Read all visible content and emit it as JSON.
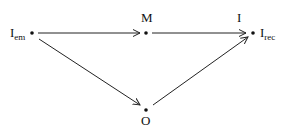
{
  "diagram": {
    "nodes": [
      {
        "id": "Iem",
        "label": "I",
        "subscript": "em"
      },
      {
        "id": "M",
        "label": "M"
      },
      {
        "id": "Irec",
        "top_label": "I",
        "label": "I",
        "subscript": "rec"
      },
      {
        "id": "O",
        "label": "O"
      }
    ],
    "edges": [
      {
        "from": "Iem",
        "to": "M"
      },
      {
        "from": "M",
        "to": "Irec",
        "label": "I"
      },
      {
        "from": "Iem",
        "to": "O"
      },
      {
        "from": "O",
        "to": "Irec"
      }
    ],
    "labels": {
      "iem_main": "I",
      "iem_sub": "em",
      "m": "M",
      "i_top": "I",
      "irec_main": "I",
      "irec_sub": "rec",
      "o": "O"
    }
  }
}
